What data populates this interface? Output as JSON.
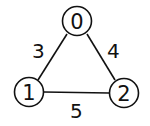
{
  "graph": {
    "nodes": [
      {
        "id": "0",
        "label": "0"
      },
      {
        "id": "1",
        "label": "1"
      },
      {
        "id": "2",
        "label": "2"
      }
    ],
    "edges": [
      {
        "from": "0",
        "to": "1",
        "weight": "3"
      },
      {
        "from": "0",
        "to": "2",
        "weight": "4"
      },
      {
        "from": "1",
        "to": "2",
        "weight": "5"
      }
    ]
  },
  "colors": {
    "stroke": "#111111",
    "background": "#ffffff"
  }
}
